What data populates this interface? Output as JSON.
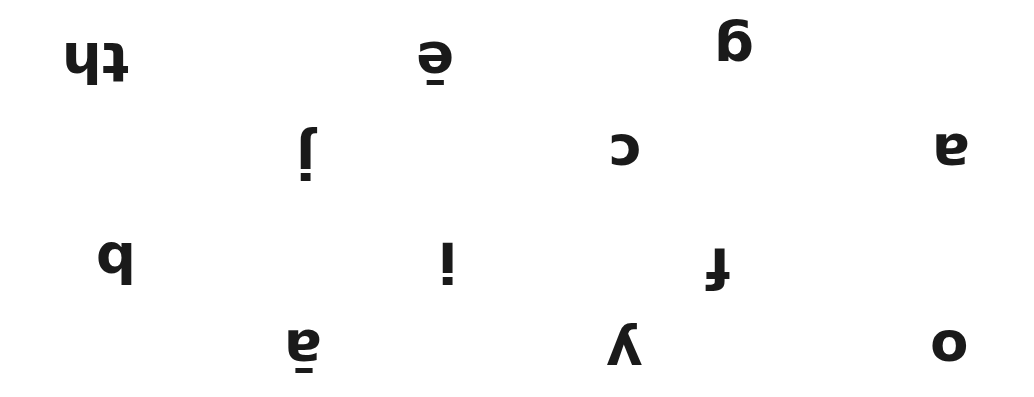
{
  "orientation": "rotated 180 degrees",
  "cards": [
    {
      "id": "th",
      "upright": "th",
      "x": 62,
      "y": 38
    },
    {
      "id": "e-long",
      "upright": "ē",
      "x": 418,
      "y": 36
    },
    {
      "id": "g",
      "upright": "g",
      "x": 716,
      "y": 20
    },
    {
      "id": "j",
      "upright": "j",
      "x": 292,
      "y": 132
    },
    {
      "id": "c",
      "upright": "c",
      "x": 608,
      "y": 132
    },
    {
      "id": "a",
      "upright": "a",
      "x": 930,
      "y": 132
    },
    {
      "id": "b",
      "upright": "b",
      "x": 96,
      "y": 234
    },
    {
      "id": "i",
      "upright": "i",
      "x": 436,
      "y": 234
    },
    {
      "id": "f",
      "upright": "f",
      "x": 704,
      "y": 234
    },
    {
      "id": "a-long",
      "upright": "ā",
      "x": 284,
      "y": 330
    },
    {
      "id": "y",
      "upright": "y",
      "x": 606,
      "y": 318
    },
    {
      "id": "o",
      "upright": "o",
      "x": 930,
      "y": 330
    }
  ]
}
